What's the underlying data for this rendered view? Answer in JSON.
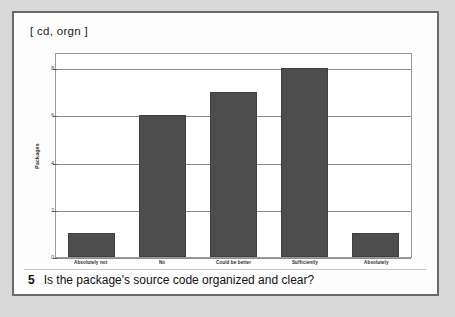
{
  "figure": {
    "tag": "[ cd, orgn ]",
    "caption_number": "5",
    "caption_text": "Is the package's source code organized and clear?"
  },
  "colors": {
    "bar_fill": "#4d4d4d",
    "bar_stroke": "#3f3f3f",
    "gridline": "#8c8c8c",
    "panel_border": "#6a6a6a",
    "page_background": "#d9d9d9",
    "panel_background": "#fdfdfd"
  },
  "chart_data": {
    "type": "bar",
    "title": "",
    "xlabel": "",
    "ylabel": "Packages",
    "categories": [
      "Absolutely not",
      "No",
      "Could be better",
      "Sufficiently",
      "Absolutely"
    ],
    "values": [
      1,
      6,
      7,
      8,
      1
    ],
    "ylim": [
      0,
      8
    ],
    "yticks": [
      0,
      2,
      4,
      6,
      8
    ],
    "ytick_labels": [
      "0",
      "2",
      "4",
      "6",
      "8"
    ],
    "grid": true,
    "legend": false
  }
}
